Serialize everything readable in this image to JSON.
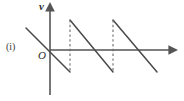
{
  "figure": {
    "item_label": "(i)",
    "origin_label": "O",
    "y_axis_label": "v",
    "x_axis_label": "",
    "top_artifact_left": "",
    "top_artifact_right": "",
    "stroke_color": "#4a4a4a",
    "axis_color": "#555555",
    "dash_color": "#6a6a6a",
    "background_color": "#ffffff"
  },
  "chart_data": {
    "type": "line",
    "title": "",
    "subtitle": "",
    "xlabel": "",
    "ylabel": "v",
    "waveform": "sawtooth",
    "grid": false,
    "legend": null,
    "axes": {
      "origin_px": [
        50,
        50
      ],
      "x_axis_from_px": [
        50,
        50
      ],
      "x_axis_to_px": [
        176,
        50
      ],
      "y_axis_from_px": [
        50,
        95
      ],
      "y_axis_to_px": [
        50,
        5
      ],
      "x_arrow": true,
      "y_arrow": true
    },
    "period_px": 43,
    "amplitude_px": 22,
    "segments": [
      {
        "name": "ramp-0-partial",
        "x1": 26,
        "y1": 28,
        "x2": 70,
        "y2": 72
      },
      {
        "name": "ramp-1",
        "x1": 70,
        "y1": 20,
        "x2": 113,
        "y2": 72
      },
      {
        "name": "ramp-2",
        "x1": 113,
        "y1": 20,
        "x2": 157,
        "y2": 72
      }
    ],
    "dashed_jumps": [
      {
        "name": "jump-1",
        "x": 70,
        "y_top": 20,
        "y_bottom": 72
      },
      {
        "name": "jump-2",
        "x": 113,
        "y_top": 20,
        "y_bottom": 72
      }
    ],
    "zero_crossings_px": [
      50,
      95,
      138
    ],
    "peaks_px": [
      {
        "x": 70,
        "y": 20
      },
      {
        "x": 113,
        "y": 20
      }
    ],
    "troughs_px": [
      {
        "x": 70,
        "y": 72
      },
      {
        "x": 113,
        "y": 72
      },
      {
        "x": 157,
        "y": 72
      }
    ]
  }
}
